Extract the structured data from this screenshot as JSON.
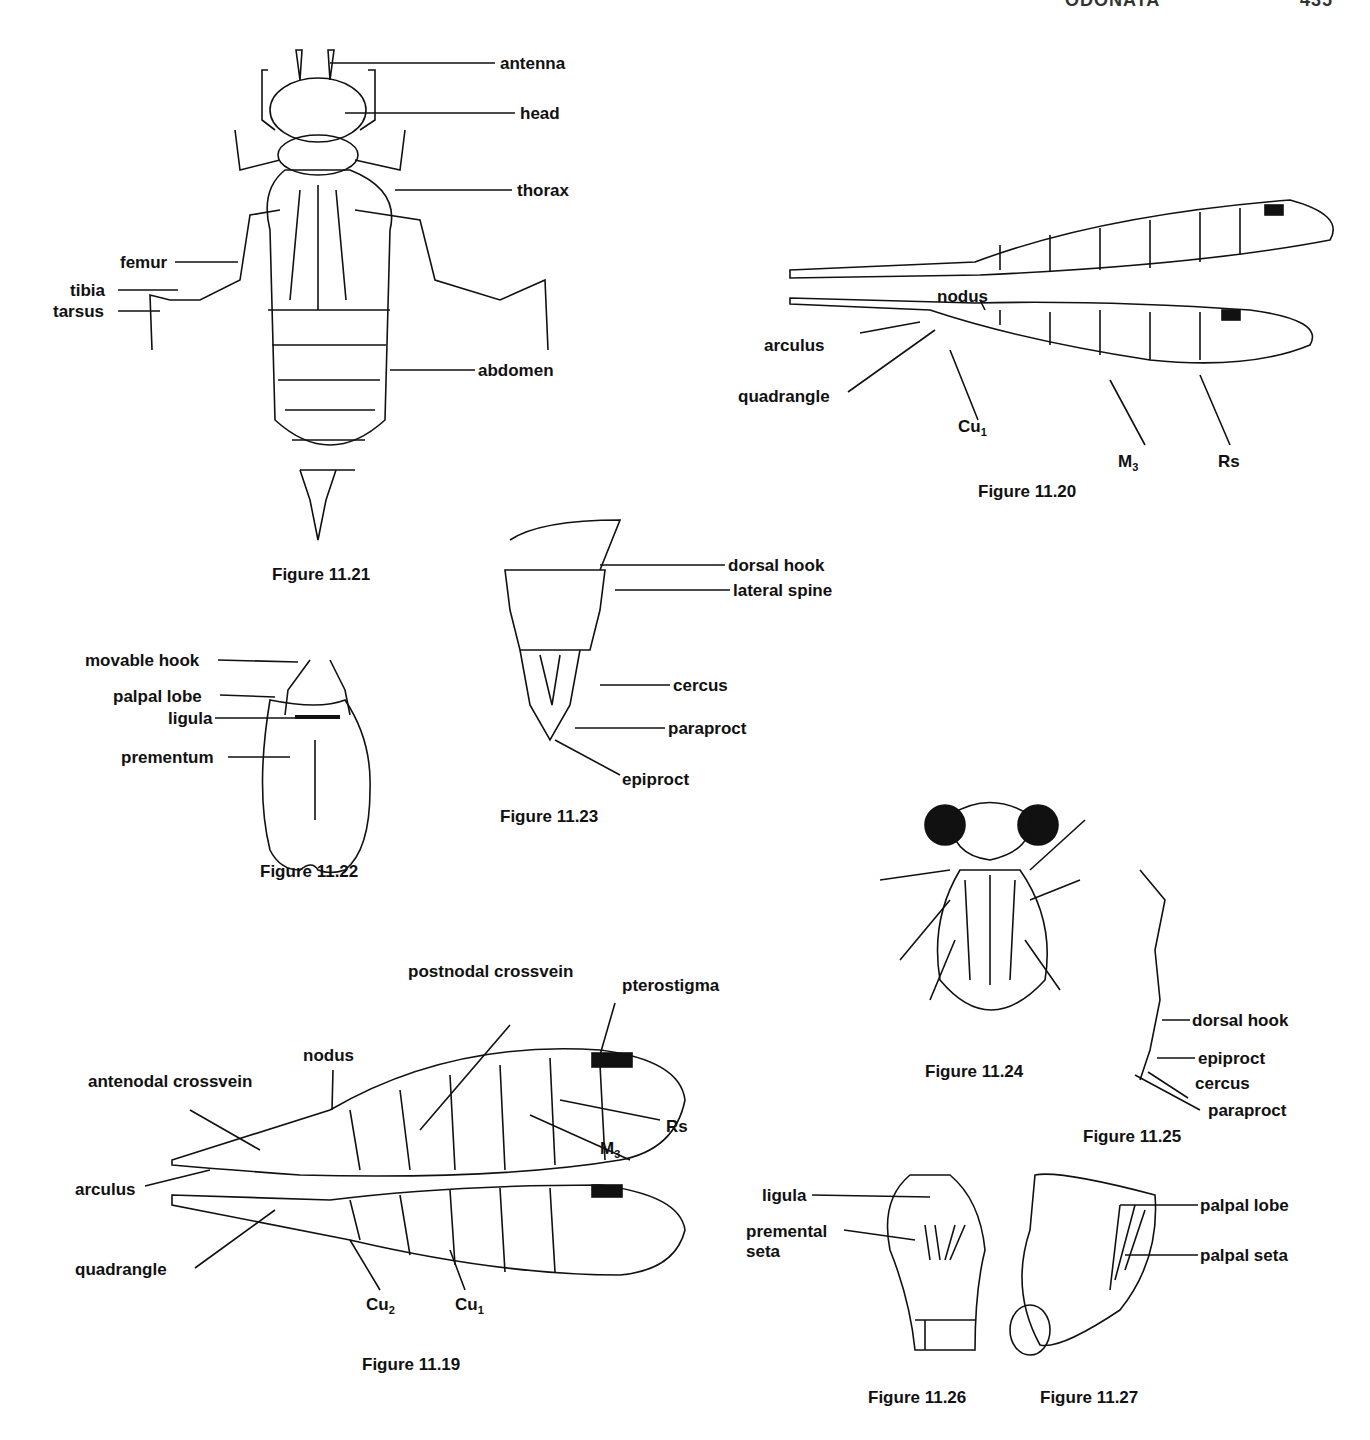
{
  "header": {
    "running_title": "ODONATA",
    "page_number": "435"
  },
  "figures": [
    {
      "id": "fig_11_21",
      "caption": "Figure 11.21",
      "labels": [
        "antenna",
        "head",
        "thorax",
        "femur",
        "tibia",
        "tarsus",
        "abdomen"
      ]
    },
    {
      "id": "fig_11_20",
      "caption": "Figure 11.20",
      "labels": [
        "nodus",
        "arculus",
        "quadrangle",
        "Cu1",
        "M3",
        "Rs"
      ]
    },
    {
      "id": "fig_11_22",
      "caption": "Figure 11.22",
      "labels": [
        "movable hook",
        "palpal lobe",
        "ligula",
        "prementum"
      ]
    },
    {
      "id": "fig_11_23",
      "caption": "Figure 11.23",
      "labels": [
        "dorsal hook",
        "lateral spine",
        "cercus",
        "paraproct",
        "epiproct"
      ]
    },
    {
      "id": "fig_11_24",
      "caption": "Figure 11.24",
      "labels": []
    },
    {
      "id": "fig_11_25",
      "caption": "Figure 11.25",
      "labels": [
        "dorsal hook",
        "epiproct",
        "cercus",
        "paraproct"
      ]
    },
    {
      "id": "fig_11_19",
      "caption": "Figure 11.19",
      "labels": [
        "postnodal crossvein",
        "pterostigma",
        "nodus",
        "antenodal crossvein",
        "Rs",
        "M3",
        "arculus",
        "quadrangle",
        "Cu2",
        "Cu1"
      ]
    },
    {
      "id": "fig_11_26",
      "caption": "Figure 11.26",
      "labels": [
        "ligula",
        "premental seta"
      ]
    },
    {
      "id": "fig_11_27",
      "caption": "Figure 11.27",
      "labels": [
        "palpal lobe",
        "palpal seta"
      ]
    }
  ],
  "labels": {
    "f21": {
      "antenna": "antenna",
      "head": "head",
      "thorax": "thorax",
      "femur": "femur",
      "tibia": "tibia",
      "tarsus": "tarsus",
      "abdomen": "abdomen"
    },
    "f20": {
      "nodus": "nodus",
      "arculus": "arculus",
      "quadrangle": "quadrangle",
      "cu1": "Cu",
      "cu1_sub": "1",
      "m3": "M",
      "m3_sub": "3",
      "rs": "Rs"
    },
    "f22": {
      "movable_hook": "movable hook",
      "palpal_lobe": "palpal lobe",
      "ligula": "ligula",
      "prementum": "prementum"
    },
    "f23": {
      "dorsal_hook": "dorsal hook",
      "lateral_spine": "lateral spine",
      "cercus": "cercus",
      "paraproct": "paraproct",
      "epiproct": "epiproct"
    },
    "f25": {
      "dorsal_hook": "dorsal hook",
      "epiproct": "epiproct",
      "cercus": "cercus",
      "paraproct": "paraproct"
    },
    "f19": {
      "postnodal": "postnodal crossvein",
      "pterostigma": "pterostigma",
      "nodus": "nodus",
      "antenodal": "antenodal crossvein",
      "rs": "Rs",
      "m3": "M",
      "m3_sub": "3",
      "arculus": "arculus",
      "quadrangle": "quadrangle",
      "cu2": "Cu",
      "cu2_sub": "2",
      "cu1": "Cu",
      "cu1_sub": "1"
    },
    "f26": {
      "ligula": "ligula",
      "premental_1": "premental",
      "premental_2": "seta"
    },
    "f27": {
      "palpal_lobe": "palpal lobe",
      "palpal_seta": "palpal seta"
    }
  },
  "captions": {
    "f21": "Figure 11.21",
    "f20": "Figure 11.20",
    "f22": "Figure 11.22",
    "f23": "Figure 11.23",
    "f24": "Figure 11.24",
    "f25": "Figure 11.25",
    "f19": "Figure 11.19",
    "f26": "Figure 11.26",
    "f27": "Figure 11.27"
  }
}
